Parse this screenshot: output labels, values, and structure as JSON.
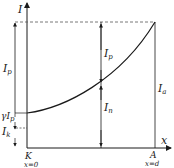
{
  "diagram": {
    "type": "current-distribution-plot",
    "axes": {
      "y_label": "I",
      "x_label": "x"
    },
    "points": {
      "K": {
        "name": "K",
        "position": "x=0"
      },
      "A": {
        "name": "A",
        "position": "x=d"
      }
    },
    "labels": {
      "Ip_left": {
        "main": "I",
        "sub": "p"
      },
      "Ip_mid": {
        "main": "I",
        "sub": "p"
      },
      "In_mid": {
        "main": "I",
        "sub": "n"
      },
      "Ia_right": {
        "main": "I",
        "sub": "a"
      },
      "gamma_Ip": {
        "prefix": "γI",
        "sub": "p"
      },
      "Ik": {
        "main": "I",
        "sub": "k"
      }
    },
    "curve": {
      "description": "Electron current rising from cathode K (x=0) to anode A (x=d)",
      "start": [
        0,
        "γIp+Ik"
      ],
      "end": [
        "d",
        "Ia"
      ]
    },
    "colors": {
      "line": "#1a1a1a",
      "dashed": "#555555",
      "background": "#ffffff"
    }
  }
}
